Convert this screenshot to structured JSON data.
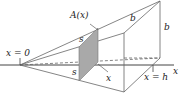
{
  "diagram": {
    "type": "solid-of-known-cross-section",
    "labels": {
      "origin": "x = 0",
      "end": "x = h",
      "axis": "x",
      "cross_section": "A(x)",
      "side_top": "s",
      "side_bottom": "s",
      "x_marker": "x",
      "top_edge": "b",
      "right_edge": "b"
    },
    "colors": {
      "line": "#555555",
      "shade": "#a9a9a9",
      "text": "#222222"
    }
  }
}
